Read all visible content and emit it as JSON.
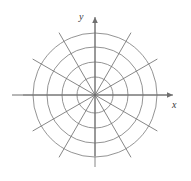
{
  "figure": {
    "background_color": "#ffffff",
    "width": 191,
    "height": 181
  },
  "axes": {
    "x": {
      "label": "x",
      "label_position": {
        "x": 172,
        "y": 100
      },
      "line": {
        "x1": 12,
        "y1": 95,
        "x2": 173,
        "y2": 95
      },
      "arrow": "right",
      "color": "#6f6f6f"
    },
    "y": {
      "label": "y",
      "label_position": {
        "x": 79,
        "y": 12
      },
      "line": {
        "x1": 95,
        "y1": 156,
        "x2": 95,
        "y2": 17
      },
      "arrow": "up",
      "color": "#6f6f6f"
    }
  },
  "chart_data": {
    "type": "line",
    "title": "",
    "subtitle": "",
    "xlabel": "x",
    "ylabel": "y",
    "grid": true,
    "legend": false,
    "coordinate_system": "polar",
    "center": {
      "x": 95,
      "y": 95
    },
    "circles": {
      "count": 4,
      "radii": [
        18,
        33,
        48,
        62
      ],
      "color": "#787878",
      "stroke_width": 0.8
    },
    "radial_lines": {
      "count": 12,
      "angle_step_degrees": 30,
      "angles_degrees": [
        0,
        30,
        60,
        90,
        120,
        150,
        180,
        210,
        240,
        270,
        300,
        330
      ],
      "extent_radius": 72,
      "color": "#686868",
      "stroke_width": 0.8
    },
    "axis_color": "#6f6f6f",
    "label_color": "#3a3a3a"
  }
}
